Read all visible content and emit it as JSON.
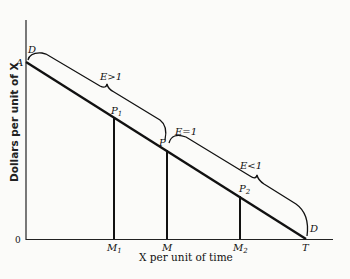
{
  "diagram": {
    "axes": {
      "x_label": "X per unit of time",
      "y_label": "Dollars per unit of X",
      "origin_label": "0"
    },
    "curve": {
      "name": "D",
      "start_label": "A",
      "end_label": "T"
    },
    "points": [
      {
        "label": "P",
        "sub": "1",
        "x_label": "M",
        "x_sub": "1"
      },
      {
        "label": "P",
        "sub": "",
        "x_label": "M",
        "x_sub": ""
      },
      {
        "label": "P",
        "sub": "2",
        "x_label": "M",
        "x_sub": "2"
      }
    ],
    "braces": [
      {
        "label": "E>1"
      },
      {
        "label": "E=1"
      },
      {
        "label": "E<1"
      }
    ],
    "labels": {
      "A": "A",
      "T": "T",
      "D_top": "D",
      "D_bottom": "D",
      "P1": "P",
      "P1_sub": "1",
      "P": "P",
      "P2": "P",
      "P2_sub": "2",
      "M1": "M",
      "M1_sub": "1",
      "M": "M",
      "M2": "M",
      "M2_sub": "2",
      "E_gt": "E>1",
      "E_eq": "E=1",
      "E_lt": "E<1"
    }
  }
}
